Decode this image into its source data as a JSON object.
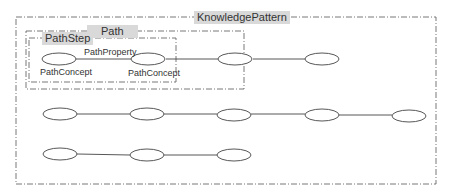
{
  "diagram": {
    "containers": {
      "knowledge_pattern": {
        "label": "KnowledgePattern"
      },
      "path": {
        "label": "Path"
      },
      "path_step": {
        "label": "PathStep"
      }
    },
    "node_labels": {
      "concept_1": "PathConcept",
      "concept_2": "PathConcept",
      "property": "PathProperty"
    },
    "rows": [
      {
        "name": "row-1",
        "node_count": 4
      },
      {
        "name": "row-2",
        "node_count": 5
      },
      {
        "name": "row-3",
        "node_count": 3
      }
    ],
    "colors": {
      "line": "#444444",
      "label_bg": "#d9d9d9",
      "border": "#555555"
    }
  }
}
